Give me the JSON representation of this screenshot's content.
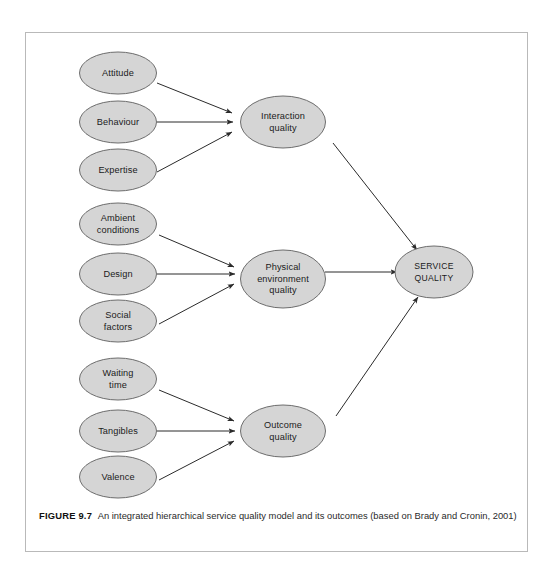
{
  "figure": {
    "caption_label": "FIGURE 9.7",
    "caption_text": "An integrated hierarchical service quality model and its outcomes (based on Brady and Cronin, 2001)"
  },
  "colors": {
    "node_fill": "#d5d5d5",
    "node_stroke": "#6d6d6d",
    "edge": "#2b2b2b",
    "frame": "#b9b9b9",
    "background": "#ffffff",
    "text": "#1b1b1b"
  },
  "diagram": {
    "type": "hierarchical-model",
    "groups": [
      {
        "name": "interaction",
        "drivers": [
          {
            "id": "attitude",
            "label": "Attitude",
            "lines": [
              "Attitude"
            ]
          },
          {
            "id": "behaviour",
            "label": "Behaviour",
            "lines": [
              "Behaviour"
            ]
          },
          {
            "id": "expertise",
            "label": "Expertise",
            "lines": [
              "Expertise"
            ]
          }
        ],
        "dimension": {
          "id": "interaction-quality",
          "label": "Interaction quality",
          "lines": [
            "Interaction",
            "quality"
          ]
        }
      },
      {
        "name": "physical-environment",
        "drivers": [
          {
            "id": "ambient-conditions",
            "label": "Ambient conditions",
            "lines": [
              "Ambient",
              "conditions"
            ]
          },
          {
            "id": "design",
            "label": "Design",
            "lines": [
              "Design"
            ]
          },
          {
            "id": "social-factors",
            "label": "Social factors",
            "lines": [
              "Social",
              "factors"
            ]
          }
        ],
        "dimension": {
          "id": "physical-environment-quality",
          "label": "Physical environment quality",
          "lines": [
            "Physical",
            "environment",
            "quality"
          ]
        }
      },
      {
        "name": "outcome",
        "drivers": [
          {
            "id": "waiting-time",
            "label": "Waiting time",
            "lines": [
              "Waiting",
              "time"
            ]
          },
          {
            "id": "tangibles",
            "label": "Tangibles",
            "lines": [
              "Tangibles"
            ]
          },
          {
            "id": "valence",
            "label": "Valence",
            "lines": [
              "Valence"
            ]
          }
        ],
        "dimension": {
          "id": "outcome-quality",
          "label": "Outcome quality",
          "lines": [
            "Outcome",
            "quality"
          ]
        }
      }
    ],
    "outcome_node": {
      "id": "service-quality",
      "label": "SERVICE QUALITY",
      "lines": [
        "SERVICE",
        "QUALITY"
      ]
    },
    "edges": [
      {
        "from": "attitude",
        "to": "interaction-quality"
      },
      {
        "from": "behaviour",
        "to": "interaction-quality"
      },
      {
        "from": "expertise",
        "to": "interaction-quality"
      },
      {
        "from": "ambient-conditions",
        "to": "physical-environment-quality"
      },
      {
        "from": "design",
        "to": "physical-environment-quality"
      },
      {
        "from": "social-factors",
        "to": "physical-environment-quality"
      },
      {
        "from": "waiting-time",
        "to": "outcome-quality"
      },
      {
        "from": "tangibles",
        "to": "outcome-quality"
      },
      {
        "from": "valence",
        "to": "outcome-quality"
      },
      {
        "from": "interaction-quality",
        "to": "service-quality"
      },
      {
        "from": "physical-environment-quality",
        "to": "service-quality"
      },
      {
        "from": "outcome-quality",
        "to": "service-quality"
      }
    ]
  }
}
